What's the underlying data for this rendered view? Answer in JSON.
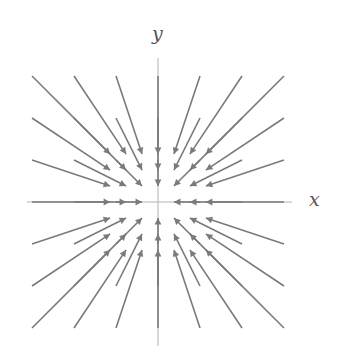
{
  "figure": {
    "background_color": "#ffffff",
    "width": 341,
    "height": 352
  },
  "axes": {
    "x_label": "x",
    "y_label": "y",
    "color": "#b3b3b3",
    "line_width": 1,
    "origin_px": {
      "x": 158,
      "y": 202
    },
    "x_extent_px": {
      "start": 27,
      "end": 292
    },
    "y_extent_px": {
      "start": 58,
      "end": 346
    }
  },
  "chart_data": {
    "type": "quiver",
    "title": "",
    "subtitle": "",
    "xlabel": "x",
    "ylabel": "y",
    "field_expression": "F(x, y) = (-x, -y)",
    "field_description": "radially inward vector field (sink at origin); arrow length proportional to distance from origin",
    "arrow_color": "#7a7a7a",
    "arrow_line_width": 1.6,
    "grid": false,
    "legend": null,
    "xlim": [
      -3.5,
      3.5
    ],
    "ylim": [
      -3.5,
      3.5
    ],
    "xticks": [
      -3,
      -2,
      -1,
      0,
      1,
      2,
      3
    ],
    "yticks": [
      -3,
      -2,
      -1,
      0,
      1,
      2,
      3
    ],
    "tick_labels_shown": false,
    "pixels_per_unit": 42,
    "scale": 0.62,
    "samples_x": [
      -3,
      -2,
      -1,
      0,
      1,
      2,
      3
    ],
    "samples_y": [
      -3,
      -2,
      -1,
      0,
      1,
      2,
      3
    ],
    "vectors": [
      {
        "x": -3,
        "y": 3,
        "u": 3,
        "v": -3
      },
      {
        "x": -2,
        "y": 3,
        "u": 2,
        "v": -3
      },
      {
        "x": -1,
        "y": 3,
        "u": 1,
        "v": -3
      },
      {
        "x": 0,
        "y": 3,
        "u": 0,
        "v": -3
      },
      {
        "x": 1,
        "y": 3,
        "u": -1,
        "v": -3
      },
      {
        "x": 2,
        "y": 3,
        "u": -2,
        "v": -3
      },
      {
        "x": 3,
        "y": 3,
        "u": -3,
        "v": -3
      },
      {
        "x": -3,
        "y": 2,
        "u": 3,
        "v": -2
      },
      {
        "x": -2,
        "y": 2,
        "u": 2,
        "v": -2
      },
      {
        "x": -1,
        "y": 2,
        "u": 1,
        "v": -2
      },
      {
        "x": 0,
        "y": 2,
        "u": 0,
        "v": -2
      },
      {
        "x": 1,
        "y": 2,
        "u": -1,
        "v": -2
      },
      {
        "x": 2,
        "y": 2,
        "u": -2,
        "v": -2
      },
      {
        "x": 3,
        "y": 2,
        "u": -3,
        "v": -2
      },
      {
        "x": -3,
        "y": 1,
        "u": 3,
        "v": -1
      },
      {
        "x": -2,
        "y": 1,
        "u": 2,
        "v": -1
      },
      {
        "x": -1,
        "y": 1,
        "u": 1,
        "v": -1
      },
      {
        "x": 0,
        "y": 1,
        "u": 0,
        "v": -1
      },
      {
        "x": 1,
        "y": 1,
        "u": -1,
        "v": -1
      },
      {
        "x": 2,
        "y": 1,
        "u": -2,
        "v": -1
      },
      {
        "x": 3,
        "y": 1,
        "u": -3,
        "v": -1
      },
      {
        "x": -3,
        "y": 0,
        "u": 3,
        "v": 0
      },
      {
        "x": -2,
        "y": 0,
        "u": 2,
        "v": 0
      },
      {
        "x": -1,
        "y": 0,
        "u": 1,
        "v": 0
      },
      {
        "x": 0,
        "y": 0,
        "u": 0,
        "v": 0
      },
      {
        "x": 1,
        "y": 0,
        "u": -1,
        "v": 0
      },
      {
        "x": 2,
        "y": 0,
        "u": -2,
        "v": 0
      },
      {
        "x": 3,
        "y": 0,
        "u": -3,
        "v": 0
      },
      {
        "x": -3,
        "y": -1,
        "u": 3,
        "v": 1
      },
      {
        "x": -2,
        "y": -1,
        "u": 2,
        "v": 1
      },
      {
        "x": -1,
        "y": -1,
        "u": 1,
        "v": 1
      },
      {
        "x": 0,
        "y": -1,
        "u": 0,
        "v": 1
      },
      {
        "x": 1,
        "y": -1,
        "u": -1,
        "v": 1
      },
      {
        "x": 2,
        "y": -1,
        "u": -2,
        "v": 1
      },
      {
        "x": 3,
        "y": -1,
        "u": -3,
        "v": 1
      },
      {
        "x": -3,
        "y": -2,
        "u": 3,
        "v": 2
      },
      {
        "x": -2,
        "y": -2,
        "u": 2,
        "v": 2
      },
      {
        "x": -1,
        "y": -2,
        "u": 1,
        "v": 2
      },
      {
        "x": 0,
        "y": -2,
        "u": 0,
        "v": 2
      },
      {
        "x": 1,
        "y": -2,
        "u": -1,
        "v": 2
      },
      {
        "x": 2,
        "y": -2,
        "u": -2,
        "v": 2
      },
      {
        "x": 3,
        "y": -2,
        "u": -3,
        "v": 2
      },
      {
        "x": -3,
        "y": -3,
        "u": 3,
        "v": 3
      },
      {
        "x": -2,
        "y": -3,
        "u": 2,
        "v": 3
      },
      {
        "x": -1,
        "y": -3,
        "u": 1,
        "v": 3
      },
      {
        "x": 0,
        "y": -3,
        "u": 0,
        "v": 3
      },
      {
        "x": 1,
        "y": -3,
        "u": -1,
        "v": 3
      },
      {
        "x": 2,
        "y": -3,
        "u": -2,
        "v": 3
      },
      {
        "x": 3,
        "y": -3,
        "u": -3,
        "v": 3
      }
    ]
  }
}
